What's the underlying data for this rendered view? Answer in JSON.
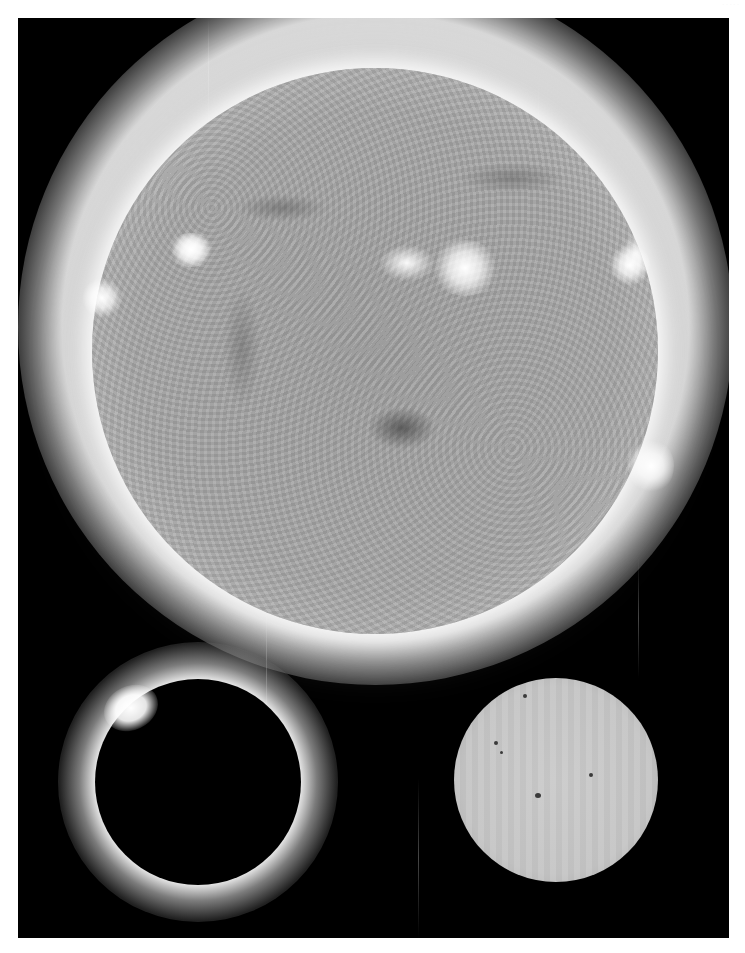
{
  "image": {
    "description": "Three views of the Sun on a black background",
    "corner_label": "· · · · ·",
    "background_color": "#000000",
    "frame_color": "#ffffff"
  },
  "panels": [
    {
      "id": "euv-sun",
      "subject": "Extreme-ultraviolet image of the full solar disc with bright active regions and corona",
      "center": [
        375,
        350
      ],
      "radius": 283,
      "active_regions": [
        {
          "x": 455,
          "y": 265,
          "brightness": "high"
        },
        {
          "x": 180,
          "y": 255,
          "brightness": "medium"
        },
        {
          "x": 625,
          "y": 260,
          "brightness": "high"
        },
        {
          "x": 100,
          "y": 295,
          "brightness": "high"
        },
        {
          "x": 650,
          "y": 465,
          "brightness": "high"
        }
      ],
      "coronal_hole": {
        "x": 415,
        "y": 445
      }
    },
    {
      "id": "eclipse",
      "subject": "Total solar eclipse, diamond ring effect",
      "center": [
        198,
        782
      ],
      "radius": 103,
      "diamond_ring_position": {
        "x": 128,
        "y": 708
      }
    },
    {
      "id": "visible-sun",
      "subject": "White-light image of the Sun with sunspots",
      "center": [
        556,
        780
      ],
      "radius": 102,
      "sunspots": [
        {
          "x": 525,
          "y": 696,
          "r": 2
        },
        {
          "x": 496,
          "y": 743,
          "r": 2
        },
        {
          "x": 501,
          "y": 752,
          "r": 1.5
        },
        {
          "x": 591,
          "y": 775,
          "r": 2
        },
        {
          "x": 538,
          "y": 796,
          "r": 3
        }
      ]
    }
  ]
}
